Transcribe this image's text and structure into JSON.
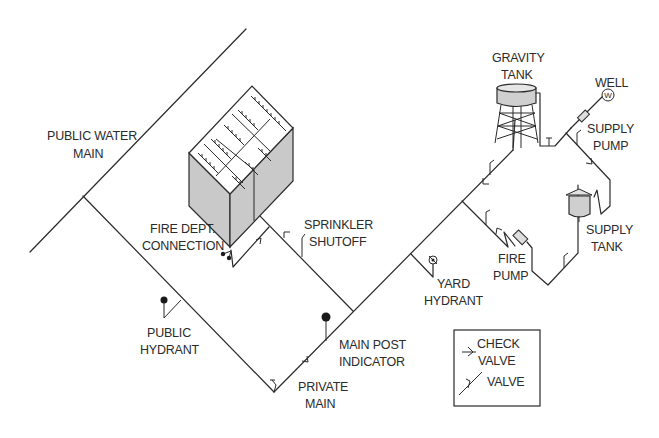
{
  "diagram": {
    "labels": {
      "public_water_main": [
        "PUBLIC WATER",
        "MAIN"
      ],
      "fire_dept_connection": [
        "FIRE DEPT.",
        "CONNECTION"
      ],
      "sprinkler_shutoff": [
        "SPRINKLER",
        "SHUTOFF"
      ],
      "public_hydrant": [
        "PUBLIC",
        "HYDRANT"
      ],
      "private_main": [
        "PRIVATE",
        "MAIN"
      ],
      "main_post_indicator": [
        "MAIN POST",
        "INDICATOR"
      ],
      "yard_hydrant": [
        "YARD",
        "HYDRANT"
      ],
      "fire_pump": [
        "FIRE",
        "PUMP"
      ],
      "gravity_tank": [
        "GRAVITY",
        "TANK"
      ],
      "well": [
        "WELL"
      ],
      "well_symbol": "W",
      "supply_pump": [
        "SUPPLY",
        "PUMP"
      ],
      "supply_tank": [
        "SUPPLY",
        "TANK"
      ]
    },
    "legend": {
      "items": [
        {
          "symbol": "check-valve",
          "label": [
            "CHECK",
            "VALVE"
          ]
        },
        {
          "symbol": "valve",
          "label": [
            "VALVE"
          ]
        }
      ]
    },
    "colors": {
      "line": "#2a2a2a",
      "shade": "#c9c9c9",
      "background": "#ffffff"
    }
  }
}
